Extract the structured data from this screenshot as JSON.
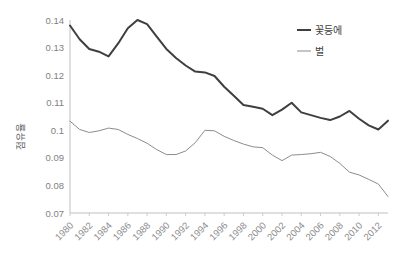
{
  "chart_data": {
    "type": "line",
    "title": "",
    "subtitle": "",
    "xlabel": "",
    "ylabel": "점유율",
    "grid": false,
    "legend_position": "top-right",
    "xlim": [
      1980,
      2013
    ],
    "ylim": [
      0.07,
      0.14
    ],
    "ytick_labels": [
      "0.14",
      "0.13",
      "0.12",
      "0.11",
      "0.1",
      "0.09",
      "0.08",
      "0.07"
    ],
    "ytick_values": [
      0.14,
      0.13,
      0.12,
      0.11,
      0.1,
      0.09,
      0.08,
      0.07
    ],
    "x": [
      1980,
      1981,
      1982,
      1983,
      1984,
      1985,
      1986,
      1987,
      1988,
      1989,
      1990,
      1991,
      1992,
      1993,
      1994,
      1995,
      1996,
      1997,
      1998,
      1999,
      2000,
      2001,
      2002,
      2003,
      2004,
      2005,
      2006,
      2007,
      2008,
      2009,
      2010,
      2011,
      2012,
      2013
    ],
    "xtick_labels": [
      "1980",
      "1982",
      "1984",
      "1986",
      "1988",
      "1990",
      "1992",
      "1994",
      "1996",
      "1998",
      "2000",
      "2002",
      "2004",
      "2006",
      "2008",
      "2010",
      "2012"
    ],
    "xtick_values": [
      1980,
      1982,
      1984,
      1986,
      1988,
      1990,
      1992,
      1994,
      1996,
      1998,
      2000,
      2002,
      2004,
      2006,
      2008,
      2010,
      2012
    ],
    "series": [
      {
        "name": "꽃등에",
        "color": "#3f3f3f",
        "width": 2.0,
        "values": [
          0.138,
          0.133,
          0.1295,
          0.1285,
          0.1268,
          0.1315,
          0.137,
          0.14,
          0.1385,
          0.134,
          0.1295,
          0.1262,
          0.1235,
          0.1213,
          0.121,
          0.1197,
          0.1158,
          0.1125,
          0.1092,
          0.1085,
          0.1078,
          0.1055,
          0.1075,
          0.11,
          0.1065,
          0.1055,
          0.1045,
          0.1037,
          0.105,
          0.107,
          0.1042,
          0.1018,
          0.1003,
          0.1035
        ]
      },
      {
        "name": "벌",
        "color": "#8c8c8c",
        "width": 1.0,
        "values": [
          0.1033,
          0.1003,
          0.0992,
          0.0998,
          0.1008,
          0.1003,
          0.0985,
          0.097,
          0.0953,
          0.093,
          0.0912,
          0.0912,
          0.0925,
          0.0955,
          0.1,
          0.0998,
          0.0978,
          0.0963,
          0.095,
          0.094,
          0.0937,
          0.091,
          0.089,
          0.091,
          0.0912,
          0.0915,
          0.092,
          0.0905,
          0.088,
          0.0848,
          0.0838,
          0.0822,
          0.0805,
          0.076
        ]
      }
    ]
  },
  "legend": {
    "items": [
      {
        "label": "꽃등에"
      },
      {
        "label": "벌"
      }
    ]
  },
  "axes": {
    "y_title": "점유율"
  }
}
